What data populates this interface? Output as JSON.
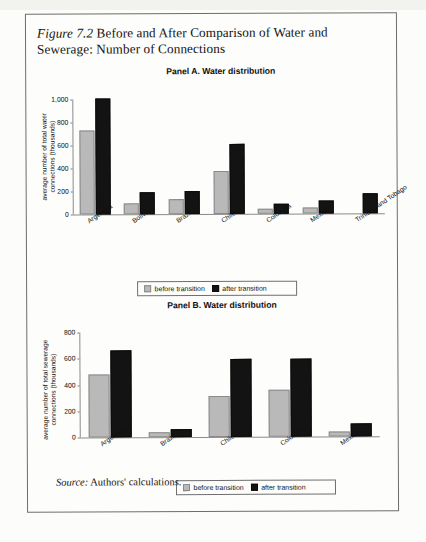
{
  "figure": {
    "label": "Figure 7.2",
    "title": " Before and After Comparison of Water and Sewerage: Number of Connections",
    "source_label": "Source:",
    "source_text": " Authors' calculations."
  },
  "legend": {
    "before_label": "before transition",
    "after_label": "after transition",
    "before_color": "#b9b9b9",
    "after_color": "#131313"
  },
  "chart_data": [
    {
      "type": "bar",
      "title": "Panel A. Water distribution",
      "ylabel": "average number of total water connections (thousands)",
      "ylabel_line1": "average number of total water",
      "ylabel_line2": "connections (thousands)",
      "xlabel": "",
      "ylim": [
        0,
        1000
      ],
      "yticks": [
        0,
        200,
        400,
        600,
        800,
        1000
      ],
      "ytick_labels": [
        "0",
        "200",
        "400",
        "600",
        "800",
        "1,000"
      ],
      "grid": false,
      "legend_position": "bottom-center",
      "categories": [
        "Argentina",
        "Bolivia",
        "Brazil",
        "Chile",
        "Colombia",
        "Mexico",
        "Trinidad and Tobago"
      ],
      "series": [
        {
          "name": "before transition",
          "values": [
            730,
            100,
            130,
            375,
            45,
            50,
            0
          ]
        },
        {
          "name": "after transition",
          "values": [
            1010,
            190,
            200,
            605,
            90,
            115,
            175
          ]
        }
      ]
    },
    {
      "type": "bar",
      "title": "Panel B. Water distribution",
      "ylabel": "average number of total sewerage connections (thousands)",
      "ylabel_line1": "average number of total sewerage",
      "ylabel_line2": "connections (thousands)",
      "xlabel": "",
      "ylim": [
        0,
        800
      ],
      "yticks": [
        0,
        200,
        400,
        600,
        800
      ],
      "ytick_labels": [
        "0",
        "200",
        "400",
        "600",
        "800"
      ],
      "grid": false,
      "legend_position": "bottom-center",
      "categories": [
        "Argentina",
        "Brazil",
        "Chile",
        "Colombia",
        "Mexico"
      ],
      "series": [
        {
          "name": "before transition",
          "values": [
            480,
            35,
            310,
            355,
            40
          ]
        },
        {
          "name": "after transition",
          "values": [
            665,
            60,
            595,
            595,
            100
          ]
        }
      ]
    }
  ]
}
